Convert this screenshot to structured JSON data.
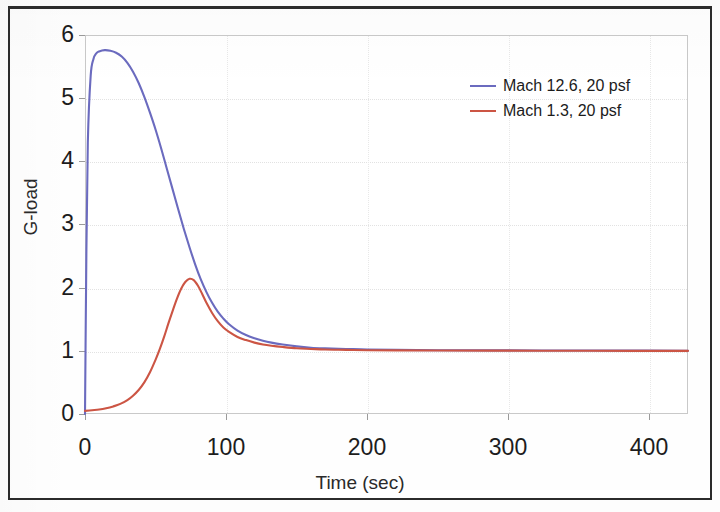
{
  "chart_data": {
    "type": "line",
    "title": "",
    "xlabel": "Time (sec)",
    "ylabel": "G-load",
    "xlim": [
      0,
      427
    ],
    "ylim": [
      0,
      6
    ],
    "xticks": [
      0,
      100,
      200,
      300,
      400
    ],
    "yticks": [
      0,
      1,
      2,
      3,
      4,
      5,
      6
    ],
    "grid": true,
    "legend_position": "upper right (inside plot)",
    "series": [
      {
        "name": "Mach 12.6, 20 psf",
        "color": "#6b6bbf",
        "x": [
          0,
          1,
          2,
          4,
          6,
          8,
          10,
          14,
          18,
          22,
          26,
          30,
          34,
          38,
          42,
          46,
          50,
          54,
          58,
          62,
          66,
          70,
          74,
          78,
          82,
          86,
          90,
          94,
          98,
          102,
          108,
          114,
          120,
          126,
          132,
          140,
          150,
          160,
          170,
          185,
          200,
          220,
          250,
          290,
          340,
          390,
          427
        ],
        "y": [
          0.0,
          2.6,
          4.3,
          5.35,
          5.62,
          5.71,
          5.74,
          5.76,
          5.75,
          5.72,
          5.66,
          5.56,
          5.42,
          5.24,
          5.02,
          4.77,
          4.5,
          4.2,
          3.88,
          3.56,
          3.24,
          2.93,
          2.64,
          2.37,
          2.13,
          1.93,
          1.76,
          1.62,
          1.51,
          1.42,
          1.32,
          1.25,
          1.2,
          1.16,
          1.13,
          1.1,
          1.07,
          1.05,
          1.04,
          1.03,
          1.02,
          1.015,
          1.01,
          1.008,
          1.005,
          1.003,
          1.0
        ]
      },
      {
        "name": "Mach 1.3, 20 psf",
        "color": "#cc5544",
        "x": [
          0,
          5,
          10,
          15,
          20,
          25,
          30,
          34,
          38,
          42,
          46,
          50,
          53,
          56,
          59,
          62,
          65,
          68,
          71,
          74,
          77,
          80,
          83,
          86,
          90,
          94,
          98,
          102,
          108,
          114,
          120,
          126,
          132,
          140,
          150,
          160,
          170,
          185,
          200,
          220,
          250,
          290,
          340,
          390,
          427
        ],
        "y": [
          0.05,
          0.06,
          0.07,
          0.09,
          0.12,
          0.16,
          0.22,
          0.29,
          0.38,
          0.5,
          0.66,
          0.86,
          1.03,
          1.22,
          1.43,
          1.63,
          1.82,
          1.98,
          2.09,
          2.14,
          2.12,
          2.03,
          1.9,
          1.76,
          1.6,
          1.47,
          1.37,
          1.3,
          1.22,
          1.17,
          1.13,
          1.1,
          1.08,
          1.06,
          1.04,
          1.03,
          1.02,
          1.015,
          1.01,
          1.008,
          1.005,
          1.003,
          1.002,
          1.0,
          1.0
        ]
      }
    ],
    "legend": [
      {
        "label": "Mach 12.6, 20 psf",
        "color": "#6b6bbf"
      },
      {
        "label": "Mach 1.3, 20 psf",
        "color": "#cc5544"
      }
    ],
    "xtick_labels": [
      "0",
      "100",
      "200",
      "300",
      "400"
    ],
    "ytick_labels": [
      "0",
      "1",
      "2",
      "3",
      "4",
      "5",
      "6"
    ]
  }
}
